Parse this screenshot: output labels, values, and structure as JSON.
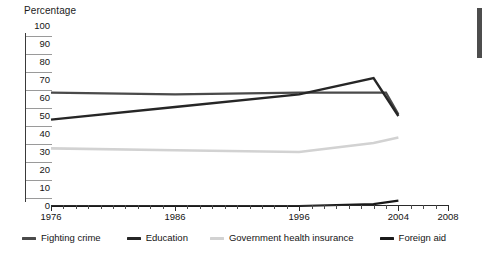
{
  "axis": {
    "y_caption": "Percentage",
    "y_ticks": [
      0,
      10,
      20,
      30,
      40,
      50,
      60,
      70,
      80,
      90,
      100
    ],
    "x_ticks": [
      1976,
      1986,
      1996,
      2004,
      2008
    ]
  },
  "decor": {
    "right_bar_color": "#4d4d4d"
  },
  "legend": {
    "items": [
      {
        "label": "Fighting crime",
        "color": "#4a4a4a"
      },
      {
        "label": "Education",
        "color": "#262626"
      },
      {
        "label": "Government health insurance",
        "color": "#d2d2d2"
      },
      {
        "label": "Foreign aid",
        "color": "#1a1a1a"
      }
    ]
  },
  "chart_data": {
    "type": "line",
    "title": "",
    "xlabel": "",
    "ylabel": "Percentage",
    "xlim": [
      1976,
      2008
    ],
    "ylim": [
      0,
      100
    ],
    "grid": false,
    "legend_position": "bottom",
    "x_tick_labels": [
      "1976",
      "1986",
      "1996",
      "2004",
      "2008"
    ],
    "y_tick_labels": [
      "0",
      "10",
      "20",
      "30",
      "40",
      "50",
      "60",
      "70",
      "80",
      "90",
      "100"
    ],
    "series": [
      {
        "name": "Fighting crime",
        "color": "#4a4a4a",
        "x": [
          1976,
          1986,
          1996,
          2002,
          2003,
          2004
        ],
        "values": [
          63,
          62,
          63,
          63,
          63,
          51
        ]
      },
      {
        "name": "Education",
        "color": "#262626",
        "x": [
          1976,
          1986,
          1996,
          2002,
          2004
        ],
        "values": [
          48,
          55,
          62,
          71,
          50
        ]
      },
      {
        "name": "Government health insurance",
        "color": "#d2d2d2",
        "x": [
          1976,
          1986,
          1996,
          2002,
          2004
        ],
        "values": [
          32,
          31,
          30,
          35,
          38
        ]
      },
      {
        "name": "Foreign aid",
        "color": "#1a1a1a",
        "x": [
          1976,
          1986,
          1996,
          2002,
          2004
        ],
        "values": [
          0,
          0,
          0,
          1,
          3
        ]
      }
    ]
  }
}
